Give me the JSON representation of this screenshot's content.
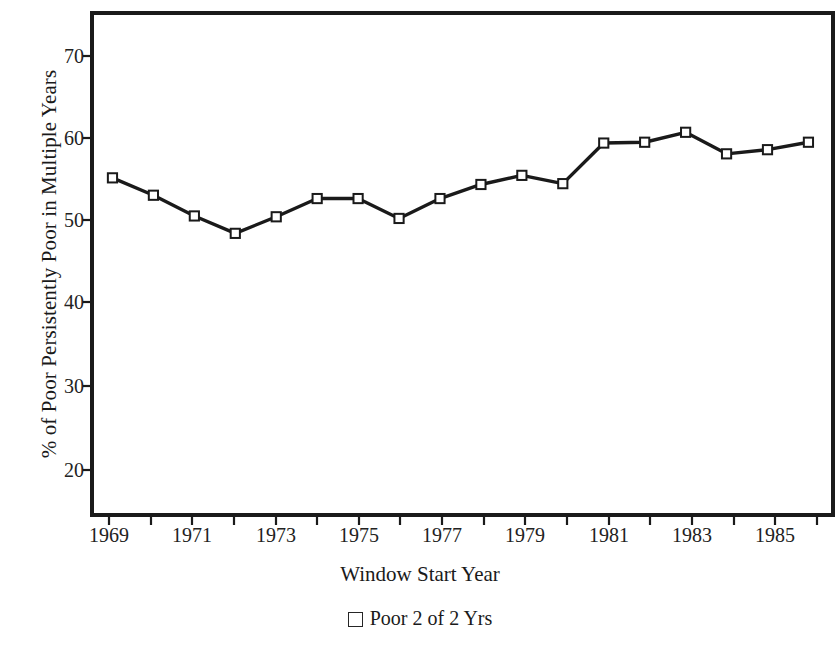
{
  "chart_data": {
    "type": "line",
    "title": "",
    "xlabel": "Window Start Year",
    "ylabel": "% of Poor Persistently Poor in Multiple Years",
    "x": [
      1969,
      1970,
      1971,
      1972,
      1973,
      1974,
      1975,
      1976,
      1977,
      1978,
      1979,
      1980,
      1981,
      1982,
      1983,
      1984,
      1985,
      1986
    ],
    "series": [
      {
        "name": "Poor 2 of 2 Yrs",
        "marker": "open-square",
        "color": "#1a1a1a",
        "values": [
          55.2,
          53.1,
          50.6,
          48.5,
          50.5,
          52.7,
          52.7,
          50.3,
          52.7,
          54.4,
          55.5,
          54.5,
          59.4,
          59.5,
          60.7,
          58.1,
          58.6,
          59.5
        ]
      }
    ],
    "xlim": [
      1968.5,
      1986.6
    ],
    "ylim": [
      14.5,
      75.1
    ],
    "xticks": [
      1969,
      1970,
      1971,
      1972,
      1973,
      1974,
      1975,
      1976,
      1977,
      1978,
      1979,
      1980,
      1981,
      1982,
      1983,
      1984,
      1985,
      1986
    ],
    "xtick_labels": [
      "1969",
      "",
      "1971",
      "",
      "1973",
      "",
      "1975",
      "",
      "1977",
      "",
      "1979",
      "",
      "1981",
      "",
      "1983",
      "",
      "1985",
      ""
    ],
    "yticks": [
      20,
      30,
      40,
      50,
      60,
      70
    ],
    "ytick_labels": [
      "20",
      "30",
      "40",
      "50",
      "60",
      "70"
    ],
    "grid": false,
    "legend_position": "bottom-center",
    "frame": true
  },
  "axis": {
    "y_title": "% of Poor Persistently Poor in Multiple Years",
    "x_title": "Window Start Year",
    "y_tick_labels": [
      "70",
      "60",
      "50",
      "40",
      "30",
      "20"
    ],
    "x_tick_labels": [
      "1969",
      "1971",
      "1973",
      "1975",
      "1977",
      "1979",
      "1981",
      "1983",
      "1985"
    ]
  },
  "legend": {
    "entries": [
      {
        "label": "Poor 2 of 2 Yrs",
        "marker": "open-square"
      }
    ]
  },
  "colors": {
    "line": "#1a1a1a",
    "frame": "#1a1a1a",
    "marker_fill": "#ffffff",
    "marker_stroke": "#1a1a1a",
    "background": "#ffffff",
    "text": "#1a1a1a"
  }
}
